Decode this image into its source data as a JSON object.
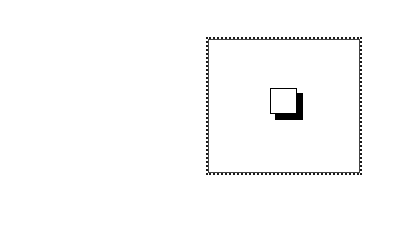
{
  "canvas": {
    "width": 393,
    "height": 241,
    "background": "#ffffff"
  },
  "frame": {
    "border_color": "#1a1a1a",
    "border_style": "dotted",
    "fill": "#ffffff"
  },
  "window_icon": {
    "icon": "window-with-drop-shadow-icon",
    "face_color": "#ffffff",
    "outline_color": "#000000",
    "shadow_color": "#000000"
  }
}
